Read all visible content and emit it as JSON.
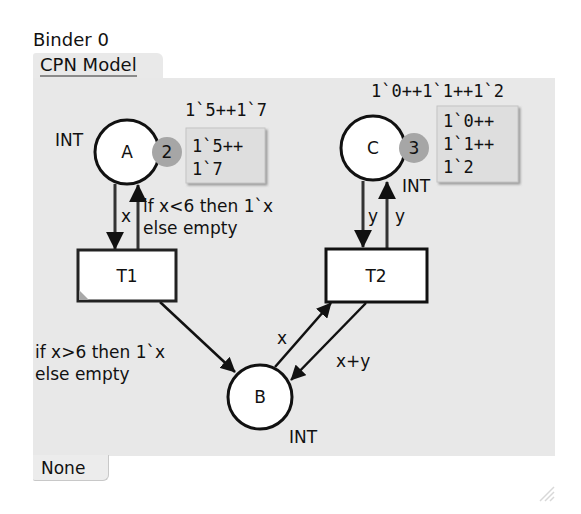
{
  "binder": {
    "title": "Binder 0"
  },
  "tabs": {
    "top": "CPN Model",
    "bottom": "None"
  },
  "colors": {
    "canvas_bg": "#e8e8e8",
    "place_fill": "#ffffff",
    "stroke": "#111111",
    "token_badge": "#a6a6a6",
    "marking_box": "#dedede"
  },
  "places": [
    {
      "id": "A",
      "name": "A",
      "type": "INT",
      "initial_marking": "1`5++1`7",
      "token_count": "2",
      "marking_lines": [
        "1`5++",
        "1`7"
      ]
    },
    {
      "id": "B",
      "name": "B",
      "type": "INT"
    },
    {
      "id": "C",
      "name": "C",
      "type": "INT",
      "initial_marking": "1`0++1`1++1`2",
      "token_count": "3",
      "marking_lines": [
        "1`0++",
        "1`1++",
        "1`2"
      ]
    }
  ],
  "transitions": [
    {
      "id": "T1",
      "name": "T1"
    },
    {
      "id": "T2",
      "name": "T2"
    }
  ],
  "arcs": [
    {
      "from": "A",
      "to": "T1",
      "inscription": "x"
    },
    {
      "from": "T1",
      "to": "A",
      "inscription_lines": [
        "if x<6 then 1`x",
        "else empty"
      ]
    },
    {
      "from": "T1",
      "to": "B",
      "inscription_lines": [
        "if x>6 then 1`x",
        "else empty"
      ]
    },
    {
      "from": "B",
      "to": "T2",
      "inscription": "x"
    },
    {
      "from": "T2",
      "to": "B",
      "inscription": "x+y"
    },
    {
      "from": "C",
      "to": "T2",
      "inscription": "y"
    },
    {
      "from": "T2",
      "to": "C",
      "inscription": "y"
    }
  ]
}
